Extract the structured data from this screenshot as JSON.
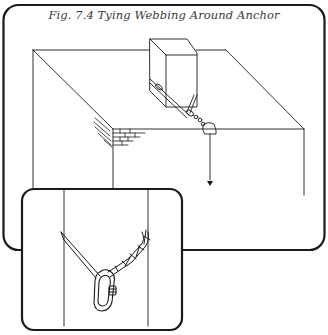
{
  "figure": {
    "title": "Fig. 7.4  Tying Webbing Around Anchor",
    "stroke_color": "#1a1a1a",
    "background": "#ffffff"
  },
  "scene": {
    "elements": [
      "building-roof",
      "anchor-block",
      "webbing-sling",
      "brick-corner",
      "edge-protector",
      "rope-down-arrow"
    ]
  },
  "inset": {
    "elements": [
      "webbing-sling",
      "carabiner",
      "tied-knot"
    ]
  }
}
